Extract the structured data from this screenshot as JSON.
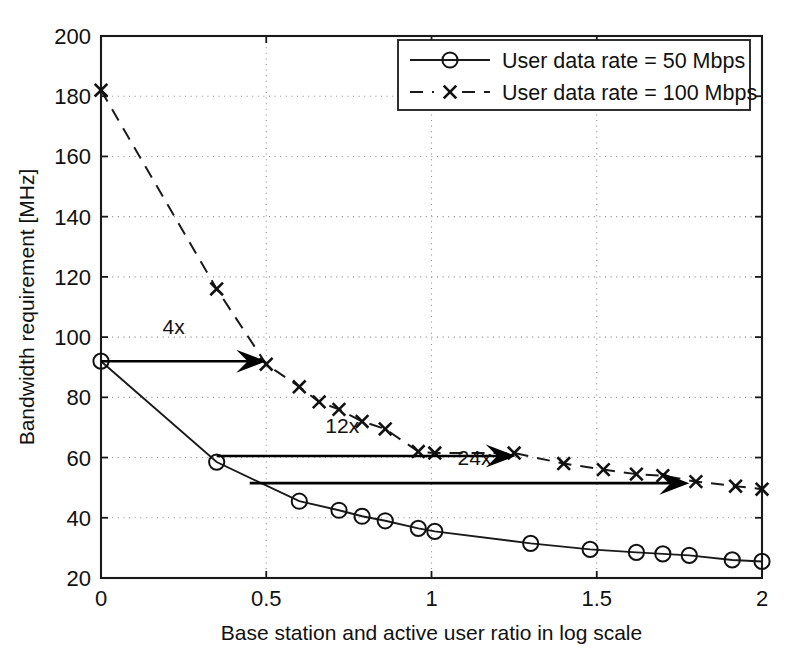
{
  "chart_data": {
    "type": "line",
    "title": "",
    "xlabel": "Base station and active user ratio in log scale",
    "ylabel": "Bandwidth requirement [MHz]",
    "xlim": [
      0,
      2
    ],
    "ylim": [
      20,
      200
    ],
    "xticks": [
      0,
      0.5,
      1,
      1.5,
      2
    ],
    "xticklabels": [
      "0",
      "0.5",
      "1",
      "1.5",
      "2"
    ],
    "yticks": [
      20,
      40,
      60,
      80,
      100,
      120,
      140,
      160,
      180,
      200
    ],
    "yticklabels": [
      "20",
      "40",
      "60",
      "80",
      "100",
      "120",
      "140",
      "160",
      "180",
      "200"
    ],
    "grid": true,
    "grid_style": "dotted",
    "legend_position": "top-right",
    "series": [
      {
        "name": "User data rate = 50 Mbps",
        "marker": "circle",
        "line_style": "solid",
        "color": "#111111",
        "x": [
          0.0,
          0.35,
          0.6,
          0.72,
          0.79,
          0.86,
          0.96,
          1.01,
          1.3,
          1.48,
          1.62,
          1.7,
          1.78,
          1.91,
          2.0
        ],
        "y": [
          92,
          58.5,
          45.5,
          42.5,
          40.5,
          39.0,
          36.5,
          35.5,
          31.5,
          29.5,
          28.5,
          28.0,
          27.5,
          26.0,
          25.5
        ]
      },
      {
        "name": "User data rate = 100 Mbps",
        "marker": "x",
        "line_style": "dashed",
        "color": "#111111",
        "x": [
          0.0,
          0.35,
          0.5,
          0.6,
          0.66,
          0.72,
          0.79,
          0.86,
          0.96,
          1.01,
          1.25,
          1.4,
          1.52,
          1.62,
          1.7,
          1.8,
          1.92,
          2.0
        ],
        "y": [
          182,
          116,
          91,
          83.5,
          78.5,
          76.0,
          72.0,
          69.5,
          62.0,
          61.5,
          61.5,
          58.0,
          56.0,
          54.5,
          54.0,
          52.0,
          50.5,
          49.5
        ]
      }
    ],
    "annotations": [
      {
        "label": "4x",
        "type": "arrow",
        "x_start": 0.0,
        "y_start": 92,
        "x_end": 0.5,
        "y_end": 92,
        "label_x": 0.22,
        "label_y": 101
      },
      {
        "label": "12x",
        "type": "arrow",
        "x_start": 0.35,
        "y_start": 60.5,
        "x_end": 1.255,
        "y_end": 60.5,
        "label_x": 0.73,
        "label_y": 68
      },
      {
        "label": "24x",
        "type": "arrow",
        "x_start": 0.45,
        "y_start": 51.5,
        "x_end": 1.78,
        "y_end": 51.5,
        "label_x": 1.13,
        "label_y": 57.5
      }
    ]
  },
  "legend": {
    "entries": [
      {
        "label": "User data rate = 50 Mbps",
        "marker": "circle",
        "line_style": "solid"
      },
      {
        "label": "User data rate = 100 Mbps",
        "marker": "x",
        "line_style": "dashed"
      }
    ]
  },
  "caption": {
    "text": ""
  },
  "colors": {
    "foreground": "#111111",
    "background": "#ffffff",
    "grid": "#8a8a8a"
  }
}
